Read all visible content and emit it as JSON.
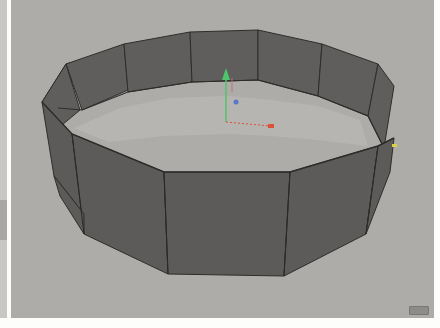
{
  "viewport": {
    "label": "3D viewport",
    "background": "#aeaca8",
    "object": {
      "type": "tube",
      "segments": 12,
      "face_color": "#5f5e5c",
      "edge_color": "#2e2d2c"
    },
    "gizmo": {
      "y_axis_color": "#4fc46a",
      "x_axis_color": "#d9533a",
      "z_axis_color": "#5a78c8"
    },
    "selection_marker_color": "#d8d24a"
  },
  "left_panel": {
    "label": "side panel"
  },
  "corner_icon": {
    "name": "viewport-corner-icon"
  }
}
